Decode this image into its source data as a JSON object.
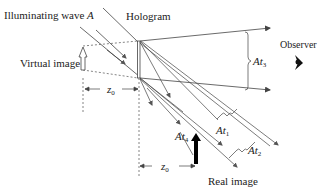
{
  "labels": {
    "illuminating_wave": "Illuminating wave",
    "illuminating_wave_symbol": "A",
    "hologram": "Hologram",
    "observer": "Observer",
    "virtual_image": "Virtual image",
    "real_image": "Real image",
    "z0_virtual": "z",
    "z0_virtual_sub": "0",
    "z0_real": "z",
    "z0_real_sub": "0",
    "at1_main": "At",
    "at1_sub": "1",
    "at2_main": "At",
    "at2_sub": "2",
    "at3_main": "At",
    "at3_sub": "3",
    "at4_main": "At",
    "at4_sub": "4"
  },
  "colors": {
    "line": "#444444",
    "dashed": "#666666",
    "real_image_arrow": "#000000"
  }
}
